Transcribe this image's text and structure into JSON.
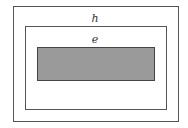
{
  "diagram": {
    "outer_box": {
      "label": "h",
      "border_color": "#555555",
      "fill": "#ffffff"
    },
    "middle_box": {
      "label": "e",
      "border_color": "#555555",
      "fill": "#ffffff"
    },
    "inner_box": {
      "label": "",
      "border_color": "#444444",
      "fill": "#9a9a9a"
    }
  }
}
